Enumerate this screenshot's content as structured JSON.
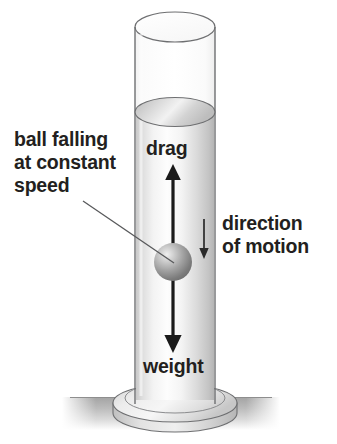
{
  "diagram": {
    "background_color": "#ffffff",
    "text_color": "#231f20",
    "labels": {
      "ball_falling": "ball falling\nat constant\nspeed",
      "drag": "drag",
      "direction_of_motion": "direction\nof motion",
      "weight": "weight"
    },
    "arrows": {
      "drag_arrow": "up-arrow-icon",
      "weight_arrow": "down-arrow-icon",
      "motion_arrow": "small-down-arrow-icon"
    },
    "shapes": {
      "cylinder": "measuring-cylinder",
      "fluid_surface": "fluid-surface-ellipse",
      "ball": "falling-ball-sphere",
      "base": "cylinder-base-disc",
      "ground": "ground-surface-band",
      "leader_line": "callout-leader-line"
    },
    "colors": {
      "outline": "#58595b",
      "fluid_light": "#fdfdfd",
      "fluid_mid": "#e3e3e3",
      "fluid_dark": "#b9b9b9",
      "ball_highlight": "#e6e6e6",
      "ball_mid": "#a8a8a8",
      "ball_dark": "#6e6e6e",
      "ground": "#a9a9a9",
      "arrow": "#1a1a1a"
    }
  }
}
